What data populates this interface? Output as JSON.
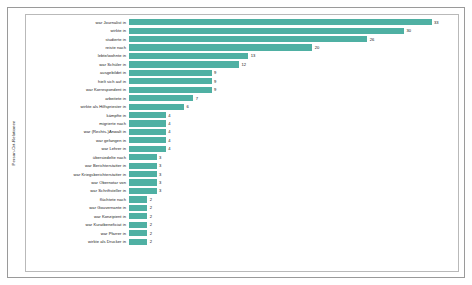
{
  "chart_data": {
    "type": "bar",
    "orientation": "horizontal",
    "title": "",
    "xlabel": "",
    "ylabel": "Person-Ort-Relationen",
    "xlim": [
      0,
      36
    ],
    "grid": false,
    "legend": null,
    "bar_color": "#4fb0a3",
    "categories": [
      "war Journalist in",
      "wirkte in",
      "studierte in",
      "reiste nach",
      "lebte/wohnte in",
      "war Schüler in",
      "ausgebildet in",
      "hielt sich auf in",
      "war Korrespondent in",
      "arbeitete in",
      "wirkte als Hilfspriester in",
      "kämpfte in",
      "migrierte nach",
      "war (Rechts-)Anwalt in",
      "war gefangen in",
      "war Lehrer in",
      "übersiedelte nach",
      "war Berichterstatter in",
      "war Kriegsberichterstatter in",
      "war Obernotar von",
      "war Schriftsteller in",
      "flüchtete nach",
      "war Gouvernante in",
      "war Konzipient in",
      "war Kuratbeneficiat in",
      "war Pfarrer in",
      "wirkte als Drucker in"
    ],
    "values": [
      33,
      30,
      26,
      20,
      13,
      12,
      9,
      9,
      9,
      7,
      6,
      4,
      4,
      4,
      4,
      4,
      3,
      3,
      3,
      3,
      3,
      2,
      2,
      2,
      2,
      2,
      2
    ]
  }
}
